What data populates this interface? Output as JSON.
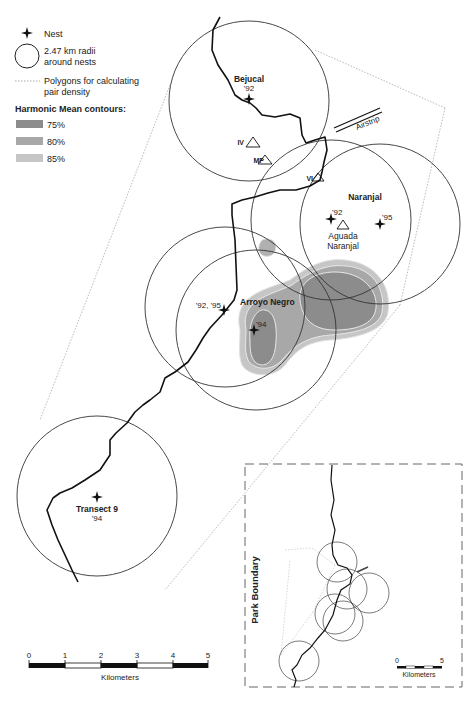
{
  "legend": {
    "nest_label": "Nest",
    "radius_label_line1": "2.47 km radii",
    "radius_label_line2": "around nests",
    "polygon_label_line1": "Polygons for calculating",
    "polygon_label_line2": "pair density",
    "contours_title": "Harmonic Mean contours:",
    "contours": [
      {
        "label": "75%",
        "color": "#8c8c8c"
      },
      {
        "label": "80%",
        "color": "#a8a8a8"
      },
      {
        "label": "85%",
        "color": "#c6c6c6"
      }
    ]
  },
  "sites": {
    "bejucal": {
      "name": "Bejucal",
      "years": "'92"
    },
    "naranjal": {
      "name": "Naranjal",
      "year_a": "'92",
      "year_b": "'95"
    },
    "aguada": {
      "line1": "Aguada",
      "line2": "Naranjal"
    },
    "arroyo": {
      "name": "Arroyo Negro",
      "years_a": "'92, '95",
      "years_b": "'94"
    },
    "transect": {
      "name": "Transect 9",
      "years": "'94"
    }
  },
  "markers": {
    "iv": "IV",
    "mp": "MP",
    "vi": "VI",
    "airstrip": "Airstrip"
  },
  "scale_bar": {
    "ticks": [
      "0",
      "1",
      "2",
      "3",
      "4",
      "5"
    ],
    "unit": "Kilometers"
  },
  "inset": {
    "boundary_label": "Park Boundary",
    "scale_ticks": [
      "0",
      "5"
    ],
    "scale_unit": "Kilometers"
  }
}
